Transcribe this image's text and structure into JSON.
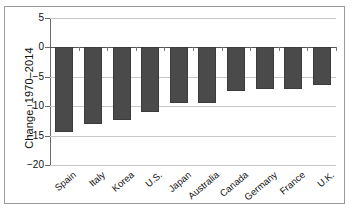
{
  "chart_data": {
    "type": "bar",
    "title": "",
    "xlabel": "",
    "ylabel": "Change, 1970–2014",
    "categories": [
      "Spain",
      "Italy",
      "Korea",
      "U.S.",
      "Japan",
      "Australia",
      "Canada",
      "Germany",
      "France",
      "U.K."
    ],
    "values": [
      -14.4,
      -13.0,
      -12.3,
      -11.0,
      -9.5,
      -9.5,
      -7.5,
      -7.0,
      -7.0,
      -6.4
    ],
    "ylim": [
      -20,
      5
    ],
    "yticks": [
      5,
      0,
      -5,
      -10,
      -15,
      -20
    ],
    "ytick_labels": [
      "5",
      "0",
      "−5",
      "−10",
      "−15",
      "−20"
    ],
    "grid": true,
    "legend": "none",
    "bar_color": "#4a4a4a",
    "gridline_color": "#c8c8c8",
    "zero_line_color": "#555555",
    "axis_color": "#6b6b6b",
    "frame_color": "#9a9a9a",
    "background": "#ffffff"
  }
}
